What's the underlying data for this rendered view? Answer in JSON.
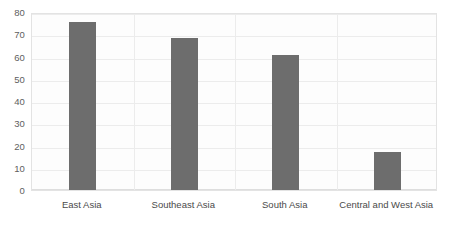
{
  "chart_data": {
    "type": "bar",
    "title": "",
    "xlabel": "",
    "ylabel": "",
    "categories": [
      "East Asia",
      "Southeast Asia",
      "South Asia",
      "Central and West Asia"
    ],
    "values": [
      75.5,
      68.5,
      60.5,
      17
    ],
    "series": [
      {
        "name": "",
        "values": [
          75.5,
          68.5,
          60.5,
          17
        ]
      }
    ],
    "ylim": [
      0,
      80
    ],
    "ytick_labels": [
      "0",
      "10",
      "20",
      "30",
      "40",
      "50",
      "60",
      "70",
      "80"
    ],
    "ytick_values": [
      0,
      10,
      20,
      30,
      40,
      50,
      60,
      70,
      80
    ],
    "grid": "horizontal-and-vertical",
    "legend": "none",
    "bar_color": "#6d6d6d",
    "plot_background": "#fdfdfd",
    "gridline_color": "#ececec",
    "axis_text_color": "#5e5e5e"
  }
}
